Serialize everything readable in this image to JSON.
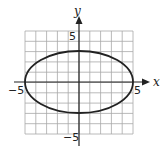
{
  "chart_data": {
    "type": "line",
    "title": "",
    "xlabel": "x",
    "ylabel": "y",
    "xlim": [
      -5,
      5
    ],
    "ylim": [
      -5,
      5
    ],
    "grid": true,
    "grid_step": 1,
    "tick_labels": {
      "x": [
        "-5",
        "5"
      ],
      "y": [
        "5",
        "-5"
      ]
    },
    "series": [
      {
        "name": "ellipse",
        "equation": "x^2/25 + y^2/9 = 1",
        "center": [
          0,
          0
        ],
        "semi_major_x": 5,
        "semi_minor_y": 3
      }
    ]
  },
  "labels": {
    "x_axis": "x",
    "y_axis": "y",
    "x_neg": "−5",
    "x_pos": "5",
    "y_pos": "5",
    "y_neg": "−5"
  },
  "colors": {
    "grid": "#a8a8a8",
    "axis": "#222222",
    "curve": "#222222"
  }
}
